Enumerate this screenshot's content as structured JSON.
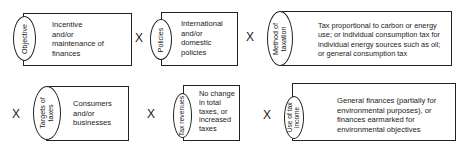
{
  "factors": [
    {
      "label": "Objective",
      "text": "Incentive\nand/or\nmaintenance of\nfinances"
    },
    {
      "label": "Policies",
      "text": "International\nand/or\ndomestic\npolicies"
    },
    {
      "label": "Method of\ntaxation",
      "text": "Tax proportional to carbon or energy\nuse; or individual consumption tax for\nindividual energy sources such as oil;\nor general consumption tax"
    },
    {
      "label": "Targets of\ntaxes",
      "text": "Consumers\nand/or\nbusinesses"
    },
    {
      "label": "Tax revenues",
      "text": "No change\nin total\ntaxes, or\nincreased\ntaxes"
    },
    {
      "label": "Use of tax\nincome",
      "text": "General finances (partially for\nenvironmental purposes), or\nfinances earmarked for\nenvironmental objectives"
    }
  ],
  "operator": "X"
}
